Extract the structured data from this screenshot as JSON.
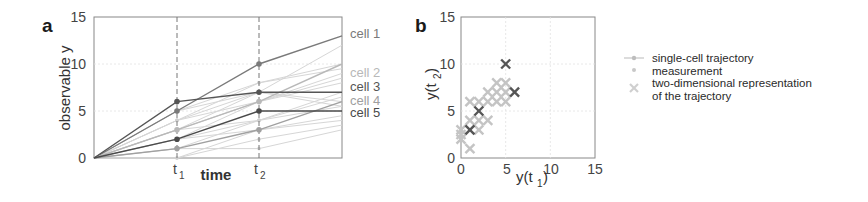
{
  "chart_data": [
    {
      "panel": "a",
      "type": "line",
      "title": "",
      "xlabel": "time",
      "ylabel": "observable y",
      "x_tick_labels": [
        "t1",
        "t2"
      ],
      "x": [
        0,
        1,
        2,
        3
      ],
      "ylim": [
        0,
        15
      ],
      "yticks": [
        0,
        5,
        10,
        15
      ],
      "grid": true,
      "highlighted_series": [
        {
          "name": "cell 1",
          "color": "#7a7a7a",
          "values": [
            0,
            5,
            10,
            13
          ]
        },
        {
          "name": "cell 2",
          "color": "#b8b8b8",
          "values": [
            0,
            3,
            6,
            10
          ]
        },
        {
          "name": "cell 3",
          "color": "#555555",
          "values": [
            0,
            6,
            7,
            7
          ]
        },
        {
          "name": "cell 4",
          "color": "#a0a0a0",
          "values": [
            0,
            1,
            3,
            6
          ]
        },
        {
          "name": "cell 5",
          "color": "#4a4a4a",
          "values": [
            0,
            2,
            5,
            5
          ]
        }
      ],
      "background_series": [
        [
          0,
          3,
          7,
          12
        ],
        [
          0,
          4,
          8,
          10
        ],
        [
          0,
          5,
          8,
          9.5
        ],
        [
          0,
          3,
          6,
          9
        ],
        [
          0,
          4,
          6,
          8
        ],
        [
          0,
          2,
          6,
          8.5
        ],
        [
          0,
          2,
          4,
          7
        ],
        [
          0,
          1,
          4,
          6.5
        ],
        [
          0,
          3,
          4,
          5.5
        ],
        [
          0,
          2,
          3,
          4
        ],
        [
          0,
          1,
          1,
          3
        ],
        [
          0,
          0,
          2,
          3.5
        ],
        [
          0,
          0,
          3,
          4.5
        ],
        [
          0,
          5,
          7,
          6
        ],
        [
          0,
          4,
          7,
          5.5
        ]
      ],
      "vlines": [
        "t1",
        "t2"
      ]
    },
    {
      "panel": "b",
      "type": "scatter",
      "title": "",
      "xlabel": "y(t1)",
      "ylabel": "y(t2)",
      "xlim": [
        0,
        15
      ],
      "ylim": [
        0,
        15
      ],
      "xticks": [
        0,
        5,
        10,
        15
      ],
      "yticks": [
        0,
        5,
        10,
        15
      ],
      "grid": true,
      "series": [
        {
          "name": "highlighted cells",
          "color": "#555555",
          "marker": "x",
          "points": [
            [
              1,
              3
            ],
            [
              2,
              5
            ],
            [
              5,
              10
            ],
            [
              6,
              7
            ]
          ]
        },
        {
          "name": "other cells",
          "color": "#c4c4c4",
          "marker": "x",
          "points": [
            [
              0,
              2
            ],
            [
              0,
              3
            ],
            [
              1,
              1
            ],
            [
              1,
              4
            ],
            [
              1,
              6
            ],
            [
              2,
              3
            ],
            [
              2,
              4
            ],
            [
              2,
              6
            ],
            [
              3,
              4
            ],
            [
              3,
              6
            ],
            [
              3,
              7
            ],
            [
              4,
              6
            ],
            [
              4,
              7
            ],
            [
              4,
              8
            ],
            [
              5,
              6
            ],
            [
              5,
              7
            ],
            [
              5,
              8
            ],
            [
              0,
              2.5
            ]
          ]
        }
      ],
      "legend": [
        "single-cell trajectory",
        "measurement",
        "two-dimensional representation of the trajectory"
      ],
      "legend_position": "right"
    }
  ],
  "panel_a": {
    "label": "a",
    "ylabel": "observable y",
    "xlabel": "time",
    "yticks": [
      "0",
      "5",
      "10",
      "15"
    ],
    "xticks": [
      "t",
      "t"
    ],
    "xtick_subs": [
      "1",
      "2"
    ],
    "cells": [
      "cell 1",
      "cell 2",
      "cell 3",
      "cell 4",
      "cell 5"
    ]
  },
  "panel_b": {
    "label": "b",
    "ylabel_main": "y(t",
    "ylabel_sub": "2",
    "xlabel_main": "y(t",
    "xlabel_sub": "1",
    "yticks": [
      "0",
      "5",
      "10",
      "15"
    ],
    "xticks": [
      "0",
      "5",
      "10",
      "15"
    ]
  },
  "legend": {
    "items": [
      {
        "icon": "line-with-dot-icon",
        "label": "single-cell trajectory"
      },
      {
        "icon": "dot-icon",
        "label": "measurement"
      },
      {
        "icon": "cross-icon",
        "label": "two-dimensional representation",
        "label2": "of the trajectory"
      }
    ]
  }
}
